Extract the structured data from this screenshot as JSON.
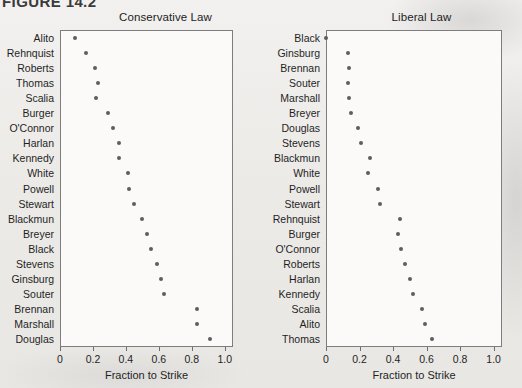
{
  "figure": {
    "number": "FIGURE 14.2"
  },
  "axis": {
    "xlabel": "Fraction to Strike",
    "ticks": [
      "0",
      "0.2",
      "0.4",
      "0.6",
      "0.8",
      "1.0"
    ],
    "tick_values": [
      0,
      0.2,
      0.4,
      0.6,
      0.8,
      1.0
    ],
    "xlim": [
      0,
      1.05
    ]
  },
  "chart_data": [
    {
      "type": "scatter",
      "title": "Conservative Law",
      "xlabel": "Fraction to Strike",
      "ylabel": "",
      "xlim": [
        0,
        1.05
      ],
      "grid": false,
      "legend": "none",
      "orientation": "horizontal-dotplot",
      "categories": [
        "Alito",
        "Rehnquist",
        "Roberts",
        "Thomas",
        "Scalia",
        "Burger",
        "O'Connor",
        "Harlan",
        "Kennedy",
        "White",
        "Powell",
        "Stewart",
        "Blackmun",
        "Breyer",
        "Black",
        "Stevens",
        "Ginsburg",
        "Souter",
        "Brennan",
        "Marshall",
        "Douglas"
      ],
      "values": [
        0.09,
        0.16,
        0.21,
        0.23,
        0.22,
        0.29,
        0.32,
        0.36,
        0.36,
        0.41,
        0.42,
        0.45,
        0.5,
        0.53,
        0.55,
        0.59,
        0.61,
        0.63,
        0.83,
        0.83,
        0.91
      ]
    },
    {
      "type": "scatter",
      "title": "Liberal Law",
      "xlabel": "Fraction to Strike",
      "ylabel": "",
      "xlim": [
        0,
        1.05
      ],
      "grid": false,
      "legend": "none",
      "orientation": "horizontal-dotplot",
      "categories": [
        "Black",
        "Ginsburg",
        "Brennan",
        "Souter",
        "Marshall",
        "Breyer",
        "Douglas",
        "Stevens",
        "Blackmun",
        "White",
        "Powell",
        "Stewart",
        "Rehnquist",
        "Burger",
        "O'Connor",
        "Roberts",
        "Harlan",
        "Kennedy",
        "Scalia",
        "Alito",
        "Thomas"
      ],
      "values": [
        0.0,
        0.13,
        0.14,
        0.13,
        0.14,
        0.15,
        0.19,
        0.21,
        0.26,
        0.25,
        0.31,
        0.32,
        0.44,
        0.43,
        0.45,
        0.47,
        0.5,
        0.52,
        0.57,
        0.59,
        0.63
      ]
    }
  ]
}
